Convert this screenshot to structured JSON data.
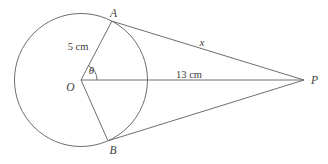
{
  "figure": {
    "type": "geometry-diagram",
    "colors": {
      "background": "#ffffff",
      "stroke": "#6e6e6e",
      "text": "#3c3c3c"
    },
    "labels": {
      "point_a": "A",
      "point_b": "B",
      "center_o": "O",
      "point_p": "P",
      "radius_length": "5 cm",
      "center_to_p_length": "13 cm",
      "tangent_length": "x",
      "angle": "θ"
    }
  }
}
